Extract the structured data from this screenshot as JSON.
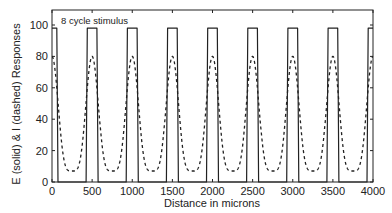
{
  "chart_data": {
    "type": "line",
    "title": "",
    "annotation": "8 cycle stimulus",
    "xlabel": "Distance in microns",
    "ylabel": "E (solid) & I (dashed) Responses",
    "xlim": [
      0,
      4000
    ],
    "ylim": [
      0,
      110
    ],
    "xticks": [
      0,
      500,
      1000,
      1500,
      2000,
      2500,
      3000,
      3500,
      4000
    ],
    "yticks": [
      0,
      20,
      40,
      60,
      80,
      100
    ],
    "grid": false,
    "legend": "none (encoded in y-axis label: E solid, I dashed)",
    "cycles": 8,
    "period_microns": 500,
    "series": [
      {
        "name": "E (solid)",
        "style": "solid",
        "description": "Square-wave-like response: plateau ~98 from cycle start to ~70 microns and from ~430 to ~570 (per 500-micron period), ~0 elsewhere",
        "x": [
          0,
          60,
          75,
          425,
          440,
          560,
          575,
          925,
          940,
          1060,
          1075,
          1425,
          1440,
          1560,
          1575,
          1925,
          1940,
          2060,
          2075,
          2425,
          2440,
          2560,
          2575,
          2925,
          2940,
          3060,
          3075,
          3425,
          3440,
          3560,
          3575,
          3925,
          3940,
          4000
        ],
        "values": [
          98,
          98,
          0,
          0,
          98,
          98,
          0,
          0,
          98,
          98,
          0,
          0,
          98,
          98,
          0,
          0,
          98,
          98,
          0,
          0,
          98,
          98,
          0,
          0,
          98,
          98,
          0,
          0,
          98,
          98,
          0,
          0,
          98,
          98
        ]
      },
      {
        "name": "I (dashed)",
        "style": "dashed",
        "description": "Smooth periodic response with peaks ~80 at multiples of 500 microns and minima ~7 at odd multiples of 250 microns",
        "peak": 80,
        "trough": 7,
        "peak_positions": [
          0,
          500,
          1000,
          1500,
          2000,
          2500,
          3000,
          3500,
          4000
        ],
        "trough_positions": [
          250,
          750,
          1250,
          1750,
          2250,
          2750,
          3250,
          3750
        ]
      }
    ]
  }
}
